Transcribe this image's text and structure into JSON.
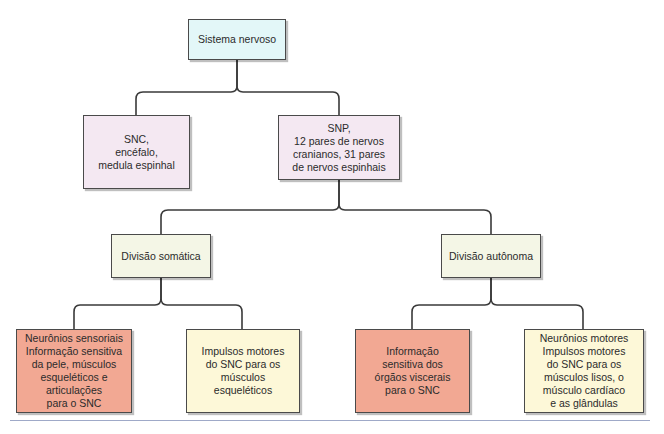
{
  "colors": {
    "root": "#e3f7f8",
    "cns_pns": "#f4e8f2",
    "division": "#f4f6e6",
    "sensory": "#f2a893",
    "motor": "#fdf8d8",
    "line": "#3a3a3a"
  },
  "diagram": {
    "root": {
      "label": "Sistema nervoso"
    },
    "snc": {
      "label": "SNC,\nencéfalo,\nmedula espinhal"
    },
    "snp": {
      "label": "SNP,\n12 pares de nervos\ncranianos, 31 pares\nde nervos espinhais"
    },
    "somatic": {
      "label": "Divisão somática"
    },
    "autonomic": {
      "label": "Divisão autônoma"
    },
    "somatic_sensory": {
      "label": "Neurônios sensoriais\nInformação sensitiva\nda pele, músculos\nesqueléticos e\narticulações\npara o SNC"
    },
    "somatic_motor": {
      "label": "Impulsos motores\ndo SNC para os\nmúsculos esqueléticos"
    },
    "autonomic_sensory": {
      "label": "Informação\nsensitiva dos\nórgãos viscerais\npara o SNC"
    },
    "autonomic_motor": {
      "label": "Neurônios motores\nImpulsos motores\ndo SNC para os\nmúsculos lisos, o\nmúsculo cardíaco\ne as glândulas"
    }
  }
}
